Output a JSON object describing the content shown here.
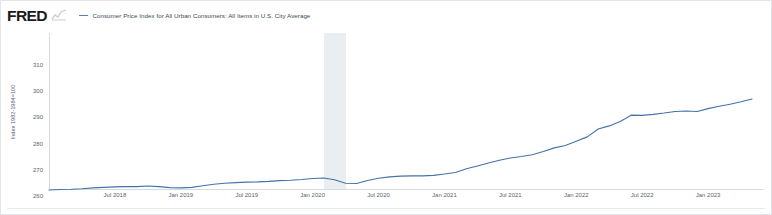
{
  "brand": {
    "logo_text": "FRED",
    "spark_icon": "line-chart-icon"
  },
  "legend": {
    "marker": "line-dash-marker",
    "label": "Consumer Price Index for All Urban Consumers: All Items in U.S. City Average"
  },
  "chart_data": {
    "type": "line",
    "title": "Consumer Price Index for All Urban Consumers: All Items in U.S. City Average",
    "xlabel": "",
    "ylabel": "Index 1982-1984=100",
    "ylim": [
      250,
      310
    ],
    "yticks": [
      310,
      300,
      290,
      280,
      270,
      260,
      250
    ],
    "ytick_labels": [
      "310",
      "300",
      "290",
      "280",
      "270",
      "260",
      "250"
    ],
    "xlim": [
      "2018-01",
      "2023-06"
    ],
    "xticks": [
      "2018-07",
      "2019-01",
      "2019-07",
      "2020-01",
      "2020-07",
      "2021-01",
      "2021-07",
      "2022-01",
      "2022-07",
      "2023-01"
    ],
    "xtick_labels": [
      "Jul 2018",
      "Jan 2019",
      "Jul 2019",
      "Jan 2020",
      "Jul 2020",
      "Jan 2021",
      "Jul 2021",
      "Jan 2022",
      "Jul 2022",
      "Jan 2023"
    ],
    "grid": false,
    "legend_position": "top",
    "line_color": "#4572a7",
    "recession_band_color": "#e8ebee",
    "recession_bands": [
      {
        "start": "2020-02",
        "end": "2020-04",
        "label": "COVID-19 recession"
      }
    ],
    "series": [
      {
        "name": "Consumer Price Index for All Urban Consumers: All Items in U.S. City Average",
        "x": [
          "2018-01",
          "2018-02",
          "2018-03",
          "2018-04",
          "2018-05",
          "2018-06",
          "2018-07",
          "2018-08",
          "2018-09",
          "2018-10",
          "2018-11",
          "2018-12",
          "2019-01",
          "2019-02",
          "2019-03",
          "2019-04",
          "2019-05",
          "2019-06",
          "2019-07",
          "2019-08",
          "2019-09",
          "2019-10",
          "2019-11",
          "2019-12",
          "2020-01",
          "2020-02",
          "2020-03",
          "2020-04",
          "2020-05",
          "2020-06",
          "2020-07",
          "2020-08",
          "2020-09",
          "2020-10",
          "2020-11",
          "2020-12",
          "2021-01",
          "2021-02",
          "2021-03",
          "2021-04",
          "2021-05",
          "2021-06",
          "2021-07",
          "2021-08",
          "2021-09",
          "2021-10",
          "2021-11",
          "2021-12",
          "2022-01",
          "2022-02",
          "2022-03",
          "2022-04",
          "2022-05",
          "2022-06",
          "2022-07",
          "2022-08",
          "2022-09",
          "2022-10",
          "2022-11",
          "2022-12",
          "2023-01",
          "2023-02",
          "2023-03",
          "2023-04",
          "2023-05"
        ],
        "values": [
          250.0,
          250.2,
          250.3,
          250.5,
          250.8,
          251.0,
          251.2,
          251.3,
          251.3,
          251.5,
          251.3,
          250.9,
          250.8,
          251.0,
          251.6,
          252.2,
          252.6,
          252.8,
          253.0,
          253.1,
          253.3,
          253.6,
          253.7,
          254.0,
          254.4,
          254.6,
          253.9,
          252.6,
          252.5,
          253.6,
          254.5,
          255.0,
          255.3,
          255.4,
          255.4,
          255.6,
          256.1,
          256.7,
          258.1,
          259.2,
          260.3,
          261.4,
          262.2,
          262.8,
          263.5,
          264.7,
          266.1,
          267.0,
          268.6,
          270.3,
          273.3,
          274.5,
          276.2,
          278.6,
          278.5,
          278.9,
          279.4,
          280.0,
          280.2,
          280.0,
          281.1,
          282.0,
          282.8,
          283.7,
          284.8
        ],
        "color": "#4572a7"
      }
    ]
  }
}
